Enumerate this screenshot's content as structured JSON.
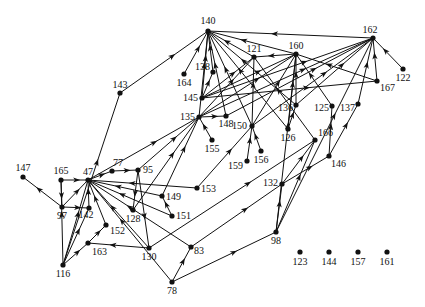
{
  "diagram": {
    "type": "directed-graph",
    "style": {
      "edge_color": "#111111",
      "node_color": "#111111",
      "background": "#ffffff"
    },
    "nodes": [
      {
        "id": "140",
        "x": 208,
        "y": 31,
        "lx": 208,
        "ly": 24,
        "anchor": "middle"
      },
      {
        "id": "162",
        "x": 373,
        "y": 38,
        "lx": 370,
        "ly": 33,
        "anchor": "middle"
      },
      {
        "id": "121",
        "x": 254,
        "y": 57,
        "lx": 254,
        "ly": 52,
        "anchor": "middle"
      },
      {
        "id": "160",
        "x": 296,
        "y": 54,
        "lx": 296,
        "ly": 49,
        "anchor": "middle"
      },
      {
        "id": "138",
        "x": 213,
        "y": 72,
        "lx": 210,
        "ly": 70,
        "anchor": "end"
      },
      {
        "id": "164",
        "x": 184,
        "y": 74,
        "lx": 184,
        "ly": 86,
        "anchor": "middle"
      },
      {
        "id": "122",
        "x": 403,
        "y": 69,
        "lx": 403,
        "ly": 81,
        "anchor": "middle"
      },
      {
        "id": "145",
        "x": 202,
        "y": 98,
        "lx": 198,
        "ly": 101,
        "anchor": "end"
      },
      {
        "id": "167",
        "x": 377,
        "y": 81,
        "lx": 380,
        "ly": 91,
        "anchor": "start"
      },
      {
        "id": "143",
        "x": 120,
        "y": 93,
        "lx": 120,
        "ly": 88,
        "anchor": "middle"
      },
      {
        "id": "136",
        "x": 296,
        "y": 105,
        "lx": 293,
        "ly": 111,
        "anchor": "end"
      },
      {
        "id": "125",
        "x": 332,
        "y": 106,
        "lx": 329,
        "ly": 111,
        "anchor": "end"
      },
      {
        "id": "137",
        "x": 358,
        "y": 104,
        "lx": 355,
        "ly": 111,
        "anchor": "end"
      },
      {
        "id": "135",
        "x": 199,
        "y": 117,
        "lx": 195,
        "ly": 120,
        "anchor": "end"
      },
      {
        "id": "148",
        "x": 226,
        "y": 116,
        "lx": 226,
        "ly": 127,
        "anchor": "middle"
      },
      {
        "id": "150",
        "x": 252,
        "y": 126,
        "lx": 247,
        "ly": 129,
        "anchor": "end"
      },
      {
        "id": "126",
        "x": 288,
        "y": 129,
        "lx": 288,
        "ly": 141,
        "anchor": "middle"
      },
      {
        "id": "155",
        "x": 212,
        "y": 140,
        "lx": 212,
        "ly": 152,
        "anchor": "middle"
      },
      {
        "id": "166",
        "x": 315,
        "y": 140,
        "lx": 318,
        "ly": 136,
        "anchor": "start"
      },
      {
        "id": "156",
        "x": 261,
        "y": 151,
        "lx": 261,
        "ly": 163,
        "anchor": "middle"
      },
      {
        "id": "159",
        "x": 247,
        "y": 161,
        "lx": 243,
        "ly": 169,
        "anchor": "end"
      },
      {
        "id": "146",
        "x": 329,
        "y": 156,
        "lx": 331,
        "ly": 167,
        "anchor": "start"
      },
      {
        "id": "147",
        "x": 23,
        "y": 177,
        "lx": 23,
        "ly": 171,
        "anchor": "middle"
      },
      {
        "id": "165",
        "x": 61,
        "y": 180,
        "lx": 61,
        "ly": 174,
        "anchor": "middle"
      },
      {
        "id": "47",
        "x": 88,
        "y": 180,
        "lx": 88,
        "ly": 175,
        "anchor": "middle"
      },
      {
        "id": "77",
        "x": 112,
        "y": 171,
        "lx": 118,
        "ly": 166,
        "anchor": "middle"
      },
      {
        "id": "95",
        "x": 138,
        "y": 170,
        "lx": 143,
        "ly": 173,
        "anchor": "start"
      },
      {
        "id": "153",
        "x": 197,
        "y": 188,
        "lx": 201,
        "ly": 192,
        "anchor": "start"
      },
      {
        "id": "132",
        "x": 282,
        "y": 184,
        "lx": 278,
        "ly": 186,
        "anchor": "end"
      },
      {
        "id": "149",
        "x": 162,
        "y": 196,
        "lx": 166,
        "ly": 200,
        "anchor": "start"
      },
      {
        "id": "97",
        "x": 62,
        "y": 207,
        "lx": 62,
        "ly": 219,
        "anchor": "middle"
      },
      {
        "id": "142",
        "x": 89,
        "y": 208,
        "lx": 86,
        "ly": 218,
        "anchor": "middle"
      },
      {
        "id": "128",
        "x": 133,
        "y": 210,
        "lx": 133,
        "ly": 222,
        "anchor": "middle"
      },
      {
        "id": "151",
        "x": 172,
        "y": 216,
        "lx": 176,
        "ly": 219,
        "anchor": "start"
      },
      {
        "id": "152",
        "x": 106,
        "y": 225,
        "lx": 110,
        "ly": 234,
        "anchor": "start"
      },
      {
        "id": "98",
        "x": 276,
        "y": 232,
        "lx": 276,
        "ly": 244,
        "anchor": "middle"
      },
      {
        "id": "83",
        "x": 191,
        "y": 247,
        "lx": 194,
        "ly": 254,
        "anchor": "start"
      },
      {
        "id": "163",
        "x": 88,
        "y": 243,
        "lx": 92,
        "ly": 255,
        "anchor": "start"
      },
      {
        "id": "130",
        "x": 149,
        "y": 248,
        "lx": 149,
        "ly": 260,
        "anchor": "middle"
      },
      {
        "id": "116",
        "x": 63,
        "y": 265,
        "lx": 63,
        "ly": 277,
        "anchor": "middle"
      },
      {
        "id": "78",
        "x": 172,
        "y": 282,
        "lx": 172,
        "ly": 294,
        "anchor": "middle"
      },
      {
        "id": "123",
        "x": 300,
        "y": 252,
        "lx": 300,
        "ly": 265,
        "anchor": "middle"
      },
      {
        "id": "144",
        "x": 329,
        "y": 252,
        "lx": 329,
        "ly": 265,
        "anchor": "middle"
      },
      {
        "id": "157",
        "x": 358,
        "y": 252,
        "lx": 358,
        "ly": 265,
        "anchor": "middle"
      },
      {
        "id": "161",
        "x": 387,
        "y": 252,
        "lx": 387,
        "ly": 265,
        "anchor": "middle"
      }
    ],
    "edges": [
      [
        "162",
        "140"
      ],
      [
        "164",
        "140"
      ],
      [
        "138",
        "140"
      ],
      [
        "145",
        "140"
      ],
      [
        "143",
        "140"
      ],
      [
        "135",
        "140"
      ],
      [
        "148",
        "140"
      ],
      [
        "150",
        "140"
      ],
      [
        "126",
        "140"
      ],
      [
        "136",
        "140"
      ],
      [
        "121",
        "140"
      ],
      [
        "160",
        "140"
      ],
      [
        "160",
        "121"
      ],
      [
        "145",
        "121"
      ],
      [
        "135",
        "121"
      ],
      [
        "150",
        "121"
      ],
      [
        "166",
        "121"
      ],
      [
        "145",
        "138"
      ],
      [
        "145",
        "160"
      ],
      [
        "135",
        "160"
      ],
      [
        "150",
        "160"
      ],
      [
        "126",
        "160"
      ],
      [
        "136",
        "160"
      ],
      [
        "125",
        "160"
      ],
      [
        "167",
        "160"
      ],
      [
        "98",
        "160"
      ],
      [
        "145",
        "162"
      ],
      [
        "135",
        "162"
      ],
      [
        "148",
        "162"
      ],
      [
        "150",
        "162"
      ],
      [
        "136",
        "162"
      ],
      [
        "137",
        "162"
      ],
      [
        "167",
        "162"
      ],
      [
        "122",
        "162"
      ],
      [
        "98",
        "162"
      ],
      [
        "145",
        "167"
      ],
      [
        "126",
        "136"
      ],
      [
        "146",
        "125"
      ],
      [
        "146",
        "137"
      ],
      [
        "155",
        "135"
      ],
      [
        "135",
        "148"
      ],
      [
        "47",
        "135"
      ],
      [
        "95",
        "135"
      ],
      [
        "149",
        "135"
      ],
      [
        "128",
        "135"
      ],
      [
        "153",
        "150"
      ],
      [
        "159",
        "150"
      ],
      [
        "156",
        "150"
      ],
      [
        "132",
        "166"
      ],
      [
        "98",
        "166"
      ],
      [
        "130",
        "166"
      ],
      [
        "132",
        "146"
      ],
      [
        "98",
        "132"
      ],
      [
        "83",
        "132"
      ],
      [
        "78",
        "83"
      ],
      [
        "78",
        "98"
      ],
      [
        "78",
        "47"
      ],
      [
        "47",
        "77"
      ],
      [
        "77",
        "95"
      ],
      [
        "95",
        "128"
      ],
      [
        "95",
        "130"
      ],
      [
        "165",
        "47"
      ],
      [
        "97",
        "142"
      ],
      [
        "142",
        "47"
      ],
      [
        "97",
        "47"
      ],
      [
        "152",
        "47"
      ],
      [
        "116",
        "47"
      ],
      [
        "149",
        "47"
      ],
      [
        "151",
        "47"
      ],
      [
        "153",
        "47"
      ],
      [
        "130",
        "47"
      ],
      [
        "83",
        "47"
      ],
      [
        "151",
        "149"
      ],
      [
        "130",
        "163"
      ],
      [
        "116",
        "163"
      ],
      [
        "163",
        "152"
      ],
      [
        "116",
        "142"
      ],
      [
        "116",
        "165"
      ],
      [
        "165",
        "97"
      ],
      [
        "97",
        "147"
      ],
      [
        "116",
        "143"
      ]
    ]
  }
}
